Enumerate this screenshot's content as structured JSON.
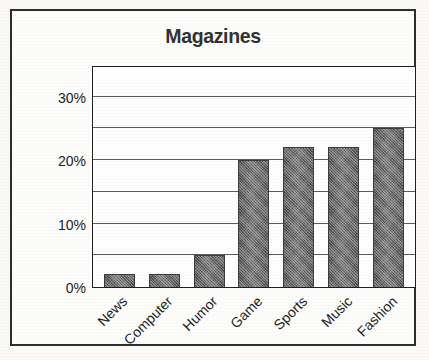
{
  "figure": {
    "border_color": "#2e2e2e",
    "background": "#fdfdfb"
  },
  "chart_data": {
    "type": "bar",
    "title": "Magazines",
    "xlabel": "",
    "ylabel": "",
    "categories": [
      "News",
      "Computer",
      "Humor",
      "Game",
      "Sports",
      "Music",
      "Fashion"
    ],
    "values": [
      2,
      2,
      5,
      20,
      22,
      22,
      25
    ],
    "value_suffix": "%",
    "ylim": [
      0,
      35
    ],
    "ytick_labels": [
      "0%",
      "10%",
      "20%",
      "30%"
    ],
    "ytick_values": [
      0,
      10,
      20,
      30
    ],
    "gridline_values": [
      5,
      10,
      15,
      20,
      25,
      30
    ],
    "grid": true,
    "legend": false,
    "bar_color": "#6d6d6d",
    "bar_edge_color": "#3d3d3d",
    "xtick_rotation": -45
  }
}
